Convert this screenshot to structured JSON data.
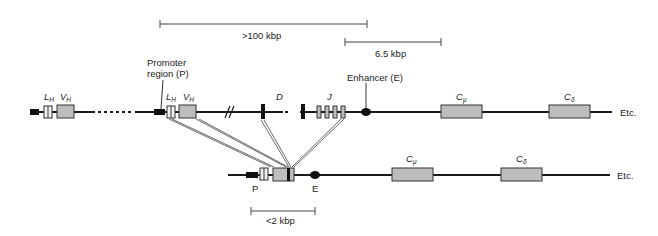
{
  "diagram": {
    "germline": {
      "labels": {
        "promoter": "Promoter region (P)",
        "promoter_line1": "Promoter",
        "promoter_line2": "region (P)",
        "enhancer": "Enhancer (E)",
        "L": "L",
        "V": "V",
        "H": "H",
        "D": "D",
        "J": "J",
        "C": "C",
        "mu": "μ",
        "delta": "δ",
        "etc": "Etc."
      }
    },
    "rearranged": {
      "labels": {
        "P": "P",
        "E": "E",
        "C": "C",
        "mu": "μ",
        "delta": "δ",
        "etc": "Etc."
      }
    },
    "scale_bars": {
      "germline_vdj": ">100 kbp",
      "enhancer_to_cmu": "6.5 kbp",
      "rearranged_p_to_e": "<2 kbp"
    },
    "colors": {
      "line": "#1a1a1a",
      "segment_fill": "#bdbdbd",
      "leader_fill": "#f2f2f2",
      "black_element": "#111111"
    }
  }
}
